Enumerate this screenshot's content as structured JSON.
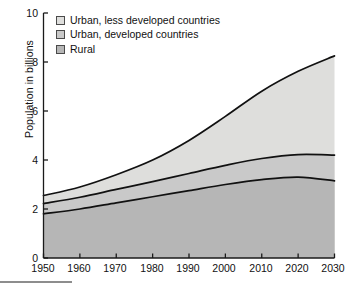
{
  "chart_data": {
    "type": "area",
    "stacked": true,
    "title": "",
    "subtitle": "",
    "xlabel": "",
    "ylabel": "Population in billions",
    "xlim": [
      1950,
      2030
    ],
    "ylim": [
      0,
      10
    ],
    "grid": false,
    "legend_position": "top-left",
    "x": [
      1950,
      1960,
      1970,
      1980,
      1990,
      2000,
      2010,
      2020,
      2030
    ],
    "xticks": [
      "1950",
      "1960",
      "1970",
      "1980",
      "1990",
      "2000",
      "2010",
      "2020",
      "2030"
    ],
    "yticks": [
      "0",
      "2",
      "4",
      "6",
      "8",
      "10"
    ],
    "series": [
      {
        "name": "Rural",
        "color": "#b6b6b6",
        "values": [
          1.8,
          2.0,
          2.25,
          2.5,
          2.75,
          3.0,
          3.2,
          3.3,
          3.15
        ]
      },
      {
        "name": "Urban, developed countries",
        "color": "#c9c9c9",
        "values": [
          0.42,
          0.48,
          0.55,
          0.62,
          0.7,
          0.78,
          0.86,
          0.92,
          1.05
        ]
      },
      {
        "name": "Urban, less developed countries",
        "color": "#dededc",
        "values": [
          0.33,
          0.42,
          0.6,
          0.88,
          1.35,
          2.0,
          2.75,
          3.4,
          4.05
        ]
      }
    ],
    "cumulative_boundaries": {
      "rural_top": [
        1.8,
        2.0,
        2.25,
        2.5,
        2.75,
        3.0,
        3.2,
        3.3,
        3.15
      ],
      "urban_developed_top": [
        2.22,
        2.48,
        2.8,
        3.12,
        3.45,
        3.78,
        4.06,
        4.22,
        4.2
      ],
      "total_top": [
        2.55,
        2.9,
        3.4,
        4.0,
        4.8,
        5.78,
        6.81,
        7.62,
        8.25
      ]
    },
    "annotations": []
  },
  "legend": {
    "items": [
      {
        "label": "Urban, less developed countries",
        "swatch": "#dededc"
      },
      {
        "label": "Urban, developed countries",
        "swatch": "#c9c9c9"
      },
      {
        "label": "Rural",
        "swatch": "#b6b6b6"
      }
    ]
  },
  "axes": {
    "y_title": "Population in billions",
    "y_ticks": [
      "10",
      "8",
      "6",
      "4",
      "2",
      "0"
    ],
    "x_ticks": [
      "1950",
      "1960",
      "1970",
      "1980",
      "1990",
      "2000",
      "2010",
      "2020",
      "2030"
    ]
  },
  "colors": {
    "axis_line": "#1a1a1a",
    "curve_line": "#111111",
    "band_light": "#dededc",
    "band_medium": "#c9c9c9",
    "band_dark": "#b6b6b6",
    "text": "#111111"
  }
}
